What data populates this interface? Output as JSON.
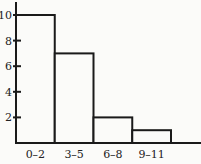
{
  "chart_data": {
    "type": "bar",
    "title": "",
    "xlabel": "",
    "ylabel": "",
    "categories": [
      "0–2",
      "3–5",
      "6–8",
      "9–11"
    ],
    "values": [
      10,
      7,
      2,
      1
    ],
    "ylim": [
      0,
      10.5
    ],
    "yticks": [
      "2",
      "4",
      "6",
      "8",
      "10"
    ],
    "grid": false,
    "legend": null,
    "style": "histogram"
  },
  "colors": {
    "line": "#1a1a1a",
    "background": "#fbfbf9",
    "bar_fill": "#fbfbf9"
  }
}
